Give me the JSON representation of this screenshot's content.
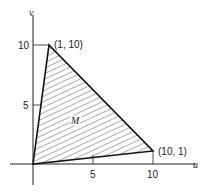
{
  "diagram": {
    "type": "region-plot",
    "axes": {
      "x_label": "u",
      "y_label": "v",
      "x_ticks": [
        {
          "value": 5,
          "label": "5"
        },
        {
          "value": 10,
          "label": "10"
        }
      ],
      "y_ticks": [
        {
          "value": 5,
          "label": "5"
        },
        {
          "value": 10,
          "label": "10"
        }
      ]
    },
    "region": {
      "label": "M",
      "fill": "hatched",
      "vertices": [
        [
          0,
          0
        ],
        [
          1,
          10
        ],
        [
          10,
          1
        ]
      ]
    },
    "point_labels": [
      {
        "label": "(1, 10)",
        "point": [
          1,
          10
        ]
      },
      {
        "label": "(10, 1)",
        "point": [
          10,
          1
        ]
      }
    ],
    "colors": {
      "stroke": "#222222",
      "background": "#ffffff"
    }
  }
}
